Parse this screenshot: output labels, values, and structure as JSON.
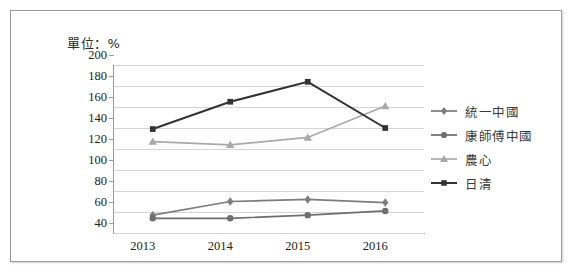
{
  "caption": "單位：%",
  "chart_data": {
    "type": "line",
    "title": "單位：%",
    "xlabel": "",
    "ylabel": "",
    "categories": [
      "2013",
      "2014",
      "2015",
      "2016"
    ],
    "ylim": [
      40,
      200
    ],
    "ytick_interval": 20,
    "yticks": [
      "200",
      "180",
      "160",
      "140",
      "120",
      "100",
      "80",
      "60",
      "40"
    ],
    "grid": true,
    "legend_position": "right",
    "series": [
      {
        "name": "統一中國",
        "marker": "diamond",
        "color": "#7d7d7d",
        "values": [
          57,
          70,
          72,
          69
        ]
      },
      {
        "name": "康師傅中國",
        "marker": "circle",
        "color": "#6e6e6e",
        "values": [
          54,
          54,
          57,
          61
        ]
      },
      {
        "name": "農心",
        "marker": "triangle",
        "color": "#a9a9a9",
        "values": [
          127,
          124,
          131,
          161
        ]
      },
      {
        "name": "日清",
        "marker": "square",
        "color": "#333333",
        "values": [
          139,
          165,
          184,
          140
        ]
      }
    ]
  },
  "legend": {
    "items": [
      {
        "label": "統一中國"
      },
      {
        "label": "康師傅中國"
      },
      {
        "label": "農心"
      },
      {
        "label": "日清"
      }
    ]
  },
  "axis": {
    "x_labels": [
      "2013",
      "2014",
      "2015",
      "2016"
    ],
    "y_labels": [
      "200",
      "180",
      "160",
      "140",
      "120",
      "100",
      "80",
      "60",
      "40"
    ]
  },
  "colors": {
    "grid": "#d4d4d4",
    "axis": "#9b9b9b",
    "frame": "#9a9a9a",
    "text": "#222222"
  }
}
